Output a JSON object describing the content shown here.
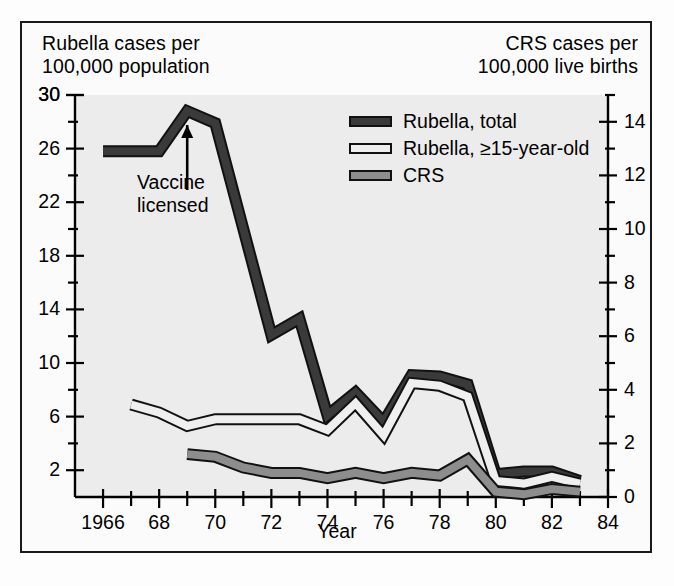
{
  "figure": {
    "left_axis_title": "Rubella cases per\n100,000 population",
    "right_axis_title": "CRS cases per\n100,000 live births",
    "xlabel": "Year",
    "annotation": "Vaccine\nlicensed",
    "annotation_year": 1969,
    "colors": {
      "plot_background": "#ececec",
      "page_background": "#fdfdfd",
      "frame_border": "#1a1a1a",
      "rubella_total": "#3a3a3a",
      "rubella_15": "#efefef",
      "crs": "#8d8d8d",
      "line_outline": "#111111",
      "text": "#000000"
    }
  },
  "legend": {
    "position": "inside-top-center",
    "items": [
      {
        "label": "Rubella, total",
        "swatch": "dark",
        "icon": "legend-swatch-icon"
      },
      {
        "label": "Rubella, ≥15-year-old",
        "swatch": "light",
        "icon": "legend-swatch-icon"
      },
      {
        "label": "CRS",
        "swatch": "gray",
        "icon": "legend-swatch-icon"
      }
    ]
  },
  "chart_data": {
    "type": "line",
    "title": "",
    "xlabel": "Year",
    "ylabel": "Rubella cases per 100,000 population",
    "y2label": "CRS cases per 100,000 live births",
    "grid": false,
    "xlim": [
      1965,
      1984
    ],
    "ylim": [
      0,
      30
    ],
    "y2lim": [
      0,
      15
    ],
    "xticks": [
      1966,
      1967,
      1968,
      1969,
      1970,
      1971,
      1972,
      1973,
      1974,
      1975,
      1976,
      1977,
      1978,
      1979,
      1980,
      1981,
      1982,
      1983,
      1984
    ],
    "xticklabels": [
      "1966",
      "",
      "68",
      "",
      "70",
      "",
      "72",
      "",
      "74",
      "",
      "76",
      "",
      "78",
      "",
      "80",
      "",
      "82",
      "",
      "84"
    ],
    "yticks": [
      2,
      6,
      10,
      14,
      18,
      22,
      26,
      30
    ],
    "yticklabels": [
      "2",
      "6",
      "10",
      "14",
      "18",
      "22",
      "26",
      "30"
    ],
    "yminorticks": [
      4,
      8,
      12,
      16,
      20,
      24,
      28
    ],
    "y2ticks": [
      0,
      2,
      4,
      6,
      8,
      10,
      12,
      14
    ],
    "y2ticklabels": [
      "0",
      "2",
      "4",
      "6",
      "8",
      "10",
      "12",
      "14"
    ],
    "y2minorticks": [
      1,
      3,
      5,
      7,
      9,
      11,
      13,
      15
    ],
    "series": [
      {
        "name": "Rubella, total",
        "axis": "left",
        "style": "dark",
        "x": [
          1966,
          1967,
          1968,
          1969,
          1970,
          1971,
          1972,
          1973,
          1974,
          1975,
          1976,
          1977,
          1978,
          1979,
          1980,
          1981,
          1982,
          1983
        ],
        "values": [
          25.8,
          25.8,
          25.8,
          28.8,
          27.9,
          20.0,
          12.1,
          13.3,
          6.1,
          7.8,
          5.6,
          9.1,
          9.0,
          8.4,
          1.7,
          1.9,
          1.9,
          1.2
        ]
      },
      {
        "name": "Rubella, ≥15-year-old",
        "axis": "left",
        "style": "light",
        "x": [
          1967,
          1968,
          1969,
          1970,
          1971,
          1972,
          1973,
          1974,
          1975,
          1976,
          1977,
          1978,
          1979,
          1980,
          1981,
          1982,
          1983
        ],
        "values": [
          6.9,
          6.3,
          5.3,
          5.8,
          5.8,
          5.8,
          5.8,
          5.0,
          7.0,
          4.6,
          8.5,
          8.3,
          7.5,
          1.2,
          1.0,
          1.5,
          1.0
        ]
      },
      {
        "name": "CRS",
        "axis": "right",
        "style": "gray",
        "x": [
          1969,
          1970,
          1971,
          1972,
          1973,
          1974,
          1975,
          1976,
          1977,
          1978,
          1979,
          1980,
          1981,
          1982,
          1983
        ],
        "values": [
          1.6,
          1.5,
          1.1,
          0.9,
          0.9,
          0.7,
          0.9,
          0.7,
          0.9,
          0.8,
          1.4,
          0.2,
          0.1,
          0.3,
          0.2
        ]
      }
    ]
  }
}
